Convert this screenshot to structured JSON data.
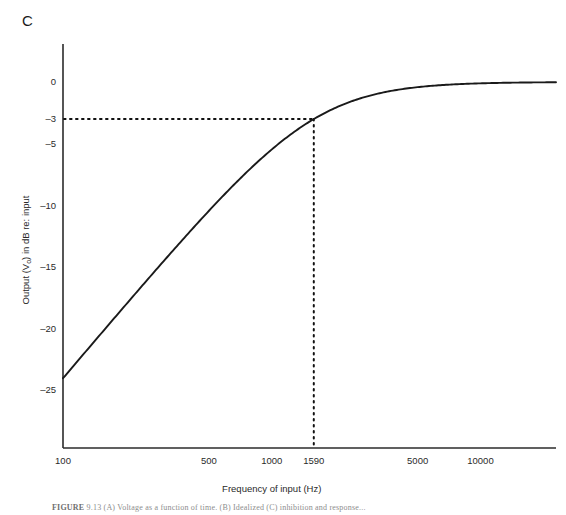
{
  "panel": {
    "label": "C"
  },
  "caption": {
    "bold_prefix": "FIGURE",
    "rest": "  9.13   (A) Voltage as a function of time. (B) Idealized  (C) inhibition and response..."
  },
  "axes": {
    "x": {
      "title": "Frequency of input (Hz)",
      "scale": "log",
      "ticks": [
        {
          "value": 100,
          "label": "100"
        },
        {
          "value": 500,
          "label": "500"
        },
        {
          "value": 1000,
          "label": "1000"
        },
        {
          "value": 1590,
          "label": "1590"
        },
        {
          "value": 5000,
          "label": "5000"
        },
        {
          "value": 10000,
          "label": "10000"
        }
      ],
      "range": [
        100,
        23000
      ]
    },
    "y": {
      "title": "Output (Vₒ) in dB re: input",
      "title_main": "Output (V",
      "title_sub": "o",
      "title_tail": ") in dB re: input",
      "scale": "linear",
      "ticks": [
        {
          "value": 0,
          "label": "0"
        },
        {
          "value": -3,
          "label": "–3"
        },
        {
          "value": -5,
          "label": "–5"
        },
        {
          "value": -10,
          "label": "–10"
        },
        {
          "value": -15,
          "label": "–15"
        },
        {
          "value": -20,
          "label": "–20"
        },
        {
          "value": -25,
          "label": "–25"
        }
      ],
      "range": [
        -27.5,
        1.5
      ]
    }
  },
  "annotations": {
    "cutoff_frequency_hz": 1590,
    "cutoff_level_db": -3,
    "guide_style": "dotted",
    "guide_color": "#111111"
  },
  "colors": {
    "curve": "#1a1a1a",
    "axis": "#2b2b2b",
    "text": "#2a2a2a",
    "background": "#ffffff"
  },
  "chart_data": {
    "type": "line",
    "title": "",
    "xlabel": "Frequency of input (Hz)",
    "ylabel": "Output (Vₒ) in dB re: input",
    "xscale": "log",
    "xlim": [
      100,
      23000
    ],
    "ylim": [
      -27.5,
      1.5
    ],
    "grid": false,
    "legend": null,
    "annotations": [
      {
        "type": "hline",
        "y": -3,
        "style": "dotted",
        "from_x": 100,
        "to_x": 1590
      },
      {
        "type": "vline",
        "x": 1590,
        "style": "dotted",
        "from_y": -27.5,
        "to_y": -3
      },
      {
        "type": "point",
        "x": 1590,
        "y": -3,
        "label": "cutoff / –3 dB point"
      }
    ],
    "series": [
      {
        "name": "High-pass filter response",
        "formula": "20*log10(f / sqrt(f^2 + 1590^2))",
        "x": [
          100,
          150,
          200,
          300,
          400,
          500,
          700,
          1000,
          1250,
          1590,
          2000,
          2500,
          3000,
          4000,
          5000,
          7000,
          10000,
          14000,
          20000,
          23000
        ],
        "y": [
          -24.0,
          -20.5,
          -18.0,
          -14.6,
          -12.2,
          -10.4,
          -7.8,
          -5.1,
          -3.8,
          -3.0,
          -2.1,
          -1.5,
          -1.1,
          -0.7,
          -0.4,
          -0.2,
          -0.1,
          -0.06,
          -0.03,
          -0.02
        ]
      }
    ]
  }
}
